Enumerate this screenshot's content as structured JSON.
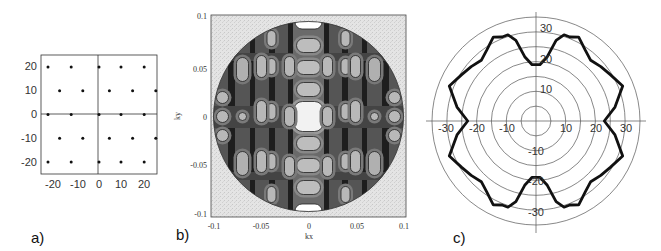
{
  "figure": {
    "panels": [
      {
        "label": "a)"
      },
      {
        "label": "b)"
      },
      {
        "label": "c)"
      }
    ]
  },
  "chart_data": [
    {
      "panel": "a)",
      "type": "scatter",
      "title": "",
      "xlabel": "",
      "ylabel": "",
      "xlim": [
        -25,
        25
      ],
      "ylim": [
        -25,
        25
      ],
      "xticks": [
        "-20",
        "-10",
        "0",
        "10",
        "20"
      ],
      "yticks": [
        "20",
        "10",
        "0",
        "-10",
        "-20"
      ],
      "grid": false,
      "description": "Triangular (hexagonal) lattice of points with axes through origin",
      "points": [
        [
          -22,
          20
        ],
        [
          -12,
          20
        ],
        [
          0,
          20
        ],
        [
          9.5,
          20
        ],
        [
          19.5,
          20
        ],
        [
          -17,
          10
        ],
        [
          -7,
          10
        ],
        [
          4.5,
          10
        ],
        [
          14.5,
          10
        ],
        [
          24.5,
          10
        ],
        [
          -22,
          0
        ],
        [
          -12,
          0
        ],
        [
          0,
          0
        ],
        [
          9.5,
          0
        ],
        [
          19.5,
          0
        ],
        [
          -17,
          -10
        ],
        [
          -7,
          -10
        ],
        [
          4.5,
          -10
        ],
        [
          14.5,
          -10
        ],
        [
          24.5,
          -10
        ],
        [
          -22,
          -20
        ],
        [
          -12,
          -20
        ],
        [
          0,
          -20
        ],
        [
          9.5,
          -20
        ],
        [
          19.5,
          -20
        ]
      ]
    },
    {
      "panel": "b)",
      "type": "heatmap",
      "title": "",
      "xlabel": "kx",
      "ylabel": "ky",
      "xlim": [
        -0.1,
        0.1
      ],
      "ylim": [
        -0.1,
        0.1
      ],
      "xticks": [
        "-0.1",
        "-0.05",
        "0",
        "0.05",
        "0.1"
      ],
      "yticks": [
        "0.1",
        "0.05",
        "0",
        "-0.05",
        "-0.1"
      ],
      "description": "Grayscale contour plot inside a circular disk of radius ~0.1; bright square at center, vertical dark bands, columns of light oval islands",
      "grid": false
    },
    {
      "panel": "c)",
      "type": "line",
      "subtype": "polar",
      "title": "",
      "xlabel": "",
      "ylabel": "",
      "radial_rings": [
        5,
        10,
        15,
        20,
        25,
        30,
        35
      ],
      "xticks": [
        "-30",
        "-20",
        "-10",
        "0",
        "10",
        "20",
        "30"
      ],
      "yticks": [
        "30",
        "20",
        "10",
        "-10",
        "-20",
        "-30"
      ],
      "grid": true,
      "series": [
        {
          "name": "polar curve",
          "angle_deg": [
            0,
            10,
            22,
            32,
            40,
            48,
            55,
            63,
            68,
            72,
            76,
            80,
            86,
            90
          ],
          "radius": [
            23,
            27,
            31.5,
            29.5,
            28.5,
            27.5,
            29,
            31.7,
            30.5,
            30.5,
            28,
            22,
            19,
            19
          ]
        }
      ],
      "symmetry": "mirror about both axes"
    }
  ]
}
